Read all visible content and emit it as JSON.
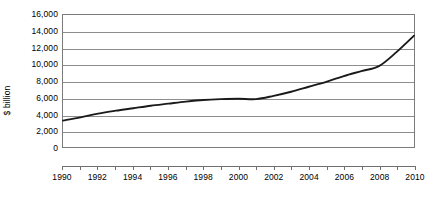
{
  "chart_data": {
    "type": "line",
    "title": "",
    "subtitle": "",
    "xlabel": "",
    "ylabel": "$ billion",
    "xlim": [
      1990,
      2010
    ],
    "ylim": [
      0,
      16000
    ],
    "grid": true,
    "legend": false,
    "legend_position": "none",
    "line_color": "#1a1a1a",
    "x_tick_interval": 1,
    "x_label_interval": 2,
    "y_tick_interval": 2000,
    "x": [
      1990,
      1991,
      1992,
      1993,
      1994,
      1995,
      1996,
      1997,
      1998,
      1999,
      2000,
      2001,
      2002,
      2003,
      2004,
      2005,
      2006,
      2007,
      2008,
      2009,
      2010
    ],
    "values": [
      3200,
      3600,
      4050,
      4400,
      4700,
      5000,
      5250,
      5500,
      5700,
      5800,
      5850,
      5800,
      6200,
      6700,
      7300,
      7900,
      8600,
      9200,
      9800,
      11500,
      13500
    ],
    "x_tick_labels": [
      "1990",
      "",
      "1992",
      "",
      "1994",
      "",
      "1996",
      "",
      "1998",
      "",
      "2000",
      "",
      "2002",
      "",
      "2004",
      "",
      "2006",
      "",
      "2008",
      "",
      "2010"
    ],
    "y_tick_labels": [
      "0",
      "2,000",
      "4,000",
      "6,000",
      "8,000",
      "10,000",
      "12,000",
      "14,000",
      "16,000"
    ],
    "y_tick_values": [
      0,
      2000,
      4000,
      6000,
      8000,
      10000,
      12000,
      14000,
      16000
    ],
    "annotations": []
  }
}
